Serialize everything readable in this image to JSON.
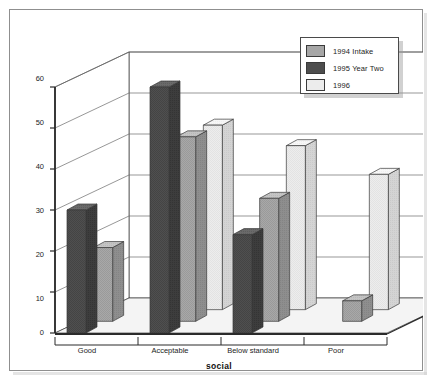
{
  "chart_data": {
    "type": "bar",
    "title": "",
    "subtitle": "",
    "xlabel": "social",
    "ylabel": "",
    "categories": [
      "Good",
      "Acceptable",
      "Below standard",
      "Poor"
    ],
    "series": [
      {
        "name": "1994 Intake",
        "values": [
          18,
          45,
          30,
          5
        ],
        "color": "#a6a6a6"
      },
      {
        "name": "1995 Year Two",
        "values": [
          30,
          60,
          24,
          0
        ],
        "color": "#4d4d4d"
      },
      {
        "name": "1996",
        "values": [
          0,
          45,
          40,
          33
        ],
        "color": "#ececec"
      }
    ],
    "ylim": [
      0,
      60
    ],
    "yticks": [
      0,
      10,
      20,
      30,
      40,
      50,
      60
    ],
    "ytick_labels": [
      "0",
      "10",
      "20",
      "30",
      "40",
      "50",
      "60"
    ],
    "grid": true,
    "three_d": true,
    "legend_position": "top-right"
  },
  "legend": {
    "entries": [
      {
        "label": "1994 Intake",
        "swatch": "medium-gray"
      },
      {
        "label": "1995 Year Two",
        "swatch": "dark-gray"
      },
      {
        "label": "1996",
        "swatch": "light-gray"
      }
    ]
  },
  "axes": {
    "y_tick_labels": [
      "60",
      "50",
      "40",
      "30",
      "20",
      "10",
      "0"
    ],
    "x_tick_labels": [
      "Good",
      "Acceptable",
      "Below standard",
      "Poor"
    ],
    "x_axis_title": "social"
  },
  "colors": {
    "series_1994": "#a6a6a6",
    "series_1995": "#4d4d4d",
    "series_1996": "#ececec",
    "frame_border": "#8f8f8f",
    "axis_line": "#333333",
    "gridline": "#666666",
    "floor": "#f2f2f2",
    "background": "#ffffff"
  }
}
